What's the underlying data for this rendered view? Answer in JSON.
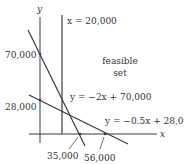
{
  "diagram": {
    "axes": {
      "x_label": "x",
      "y_label": "y"
    },
    "constraints": [
      {
        "id": "vertical",
        "equation": "x = 20,000"
      },
      {
        "id": "line1",
        "equation": "y = −2x + 70,000",
        "y_intercept": "70,000",
        "x_intercept": "35,000"
      },
      {
        "id": "line2",
        "equation": "y = −0.5x + 28,000",
        "y_intercept": "28,000",
        "x_intercept": "56,000"
      }
    ],
    "region_label_line1": "feasible",
    "region_label_line2": "set"
  }
}
